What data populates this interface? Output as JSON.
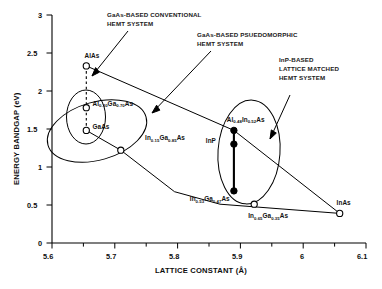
{
  "chart_data": {
    "type": "scatter",
    "title": "",
    "xlabel": "LATTICE CONSTANT (Å)",
    "ylabel": "ENERGY BANDGAP (eV)",
    "xlim": [
      5.6,
      6.1
    ],
    "ylim": [
      0,
      3
    ],
    "xticks": [
      "5.6",
      "5.7",
      "5.8",
      "5.9",
      "6",
      "6.1"
    ],
    "xtick_values": [
      5.6,
      5.7,
      5.8,
      5.9,
      6.0,
      6.1
    ],
    "xminor_step": 0.05,
    "yticks": [
      "0",
      "0.5",
      "1",
      "1.5",
      "2",
      "2.5",
      "3"
    ],
    "ytick_values": [
      0,
      0.5,
      1.0,
      1.5,
      2.0,
      2.5,
      3.0
    ],
    "grid": false,
    "legend": "none",
    "points": [
      {
        "id": "alas",
        "label": "AlAs",
        "label_html": "AlAs",
        "x": 5.655,
        "y": 2.33,
        "marker": "open",
        "label_dx": -2,
        "label_dy": -10
      },
      {
        "id": "algaas",
        "label": "Al0.30Ga0.70As",
        "label_html": "Al<sub>0.30</sub>Ga<sub>0.70</sub>As",
        "x": 5.655,
        "y": 1.78,
        "marker": "open",
        "label_dx": 6,
        "label_dy": -4
      },
      {
        "id": "gaas",
        "label": "GaAs",
        "label_html": "GaAs",
        "x": 5.655,
        "y": 1.48,
        "marker": "open",
        "label_dx": 6,
        "label_dy": -4
      },
      {
        "id": "ingaas15",
        "label": "In0.15Ga0.85As",
        "label_html": "In<sub>0.15</sub>Ga<sub>0.85</sub>As",
        "x": 5.71,
        "y": 1.22,
        "marker": "open",
        "label_dx": 24,
        "label_dy": -12
      },
      {
        "id": "alinas",
        "label": "Al0.48In0.52As",
        "label_html": "Al<sub>0.48</sub>In<sub>0.52</sub>As",
        "x": 5.872,
        "y": 1.48,
        "marker": "filled",
        "label_dx": 4,
        "label_dy": -11
      },
      {
        "id": "inp",
        "label": "InP",
        "label_html": "InP",
        "x": 5.872,
        "y": 1.3,
        "marker": "filled",
        "label_dx": -17,
        "label_dy": -3
      },
      {
        "id": "ingaas53",
        "label": "In0.53Ga0.47As",
        "label_html": "In<sub>0.53</sub>Ga<sub>0.47</sub>As",
        "x": 5.872,
        "y": 0.68,
        "marker": "filled",
        "label_dx": -33,
        "label_dy": 8
      },
      {
        "id": "ingaas65",
        "label": "In0.65Ga0.35As",
        "label_html": "In<sub>0.65</sub>Ga<sub>0.35</sub>As",
        "x": 5.922,
        "y": 0.51,
        "marker": "open",
        "label_dx": -6,
        "label_dy": 12
      },
      {
        "id": "inas",
        "label": "InAs",
        "label_html": "InAs",
        "x": 6.058,
        "y": 0.39,
        "marker": "open",
        "label_dx": -3,
        "label_dy": -10
      }
    ],
    "connectors": [
      {
        "id": "alas-gaas-dashed",
        "style": "dashed",
        "from": "alas",
        "to": "gaas",
        "note": "vertical dashed line through AlAs, AlGaAs, GaAs"
      },
      {
        "id": "inp-column",
        "style": "thick",
        "from": "alinas",
        "to": "ingaas53",
        "note": "vertical line joining AlInAs, InP, InGaAs at 5.87"
      },
      {
        "id": "gaas-inas",
        "style": "solid",
        "from": "gaas",
        "to": "inas",
        "note": "GaAs-InAs alloy line through In0.15Ga0.85As and In0.65Ga0.35As"
      },
      {
        "id": "alas-inas",
        "style": "solid",
        "from": "alas",
        "to": "inas",
        "note": "AlAs-InAs alloy line through Al0.48In0.52As"
      }
    ],
    "regions": [
      {
        "id": "conventional",
        "label": "GaAs-BASED CONVENTIONAL HEMT SYSTEM",
        "shape": "ellipse"
      },
      {
        "id": "pseudomorphic",
        "label": "GaAs-BASED PSUEDOMORPHIC HEMT SYSTEM",
        "shape": "ellipse"
      },
      {
        "id": "latticematched",
        "label": "InP-BASED LATTICE MATCHED HEMT SYSTEM",
        "shape": "ellipse"
      }
    ],
    "annotations": [
      {
        "id": "conventional",
        "lines": [
          "GaAs-BASED CONVENTIONAL",
          "HEMT SYSTEM"
        ]
      },
      {
        "id": "pseudomorphic",
        "lines": [
          "GaAs-BASED PSUEDOMORPHIC",
          "HEMT SYSTEM"
        ]
      },
      {
        "id": "latticematched",
        "lines": [
          "InP-BASED",
          "LATTICE MATCHED",
          "HEMT SYSTEM"
        ]
      }
    ],
    "colors": {
      "axis": "#000000",
      "marker_edge": "#000000",
      "marker_fill_open": "#ffffff",
      "marker_fill_closed": "#000000",
      "text": "#111111",
      "background": "#ffffff"
    }
  },
  "axes": {
    "x_title": "LATTICE CONSTANT (Å)",
    "y_title": "ENERGY BANDGAP (eV)",
    "x_tick_labels": [
      "5.6",
      "5.7",
      "5.8",
      "5.9",
      "6",
      "6.1"
    ],
    "y_tick_labels": [
      "0",
      "0.5",
      "1",
      "1.5",
      "2",
      "2.5",
      "3"
    ]
  },
  "annotations": {
    "conventional": {
      "line1": "GaAs-BASED CONVENTIONAL",
      "line2": "HEMT SYSTEM"
    },
    "pseudomorphic": {
      "line1": "GaAs-BASED PSUEDOMORPHIC",
      "line2": "HEMT SYSTEM"
    },
    "latticematched": {
      "line1": "InP-BASED",
      "line2": "LATTICE MATCHED",
      "line3": "HEMT SYSTEM"
    }
  }
}
